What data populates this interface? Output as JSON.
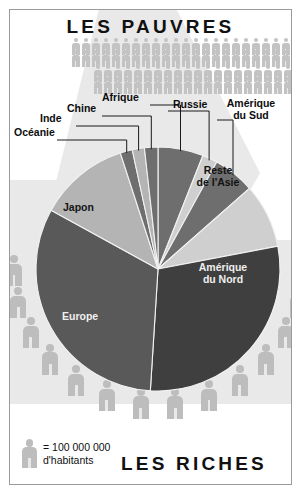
{
  "poster": {
    "title_top": "LES PAUVRES",
    "title_bottom": "LES RICHES"
  },
  "legend": {
    "icon": "person-icon",
    "line1": "= 100 000 000",
    "line2": "d'habitants",
    "unit_value": 100000000
  },
  "labels": {
    "oceanie": "Océanie",
    "inde": "Inde",
    "chine": "Chine",
    "afrique": "Afrique",
    "russie": "Russie",
    "amerique_du_sud_l1": "Amérique",
    "amerique_du_sud_l2": "du Sud",
    "reste_asie_l1": "Reste",
    "reste_asie_l2": "de l'Asie",
    "amerique_du_nord_l1": "Amérique",
    "amerique_du_nord_l2": "du Nord",
    "europe": "Europe",
    "japon": "Japon"
  },
  "colors": {
    "background": "#e9e9e9",
    "beam": "#ffffff",
    "frame": "#9a9a9a",
    "figure": "#bdbdbd",
    "figure_small": "#c3c3c3",
    "text": "#111111",
    "slice_dark": "#3f3f3f",
    "slice_mid": "#595959",
    "slice_mid2": "#6e6e6e",
    "slice_light": "#b4b4b4",
    "slice_lighter": "#cfcfcf",
    "slice_sep": "#f2f2f2",
    "leader_line": "#1a1a1a"
  },
  "chart_data": {
    "type": "pie",
    "center": {
      "x": 148,
      "y": 259
    },
    "radius": 122,
    "start_angle_deg": -90,
    "unit": "part de la richesse mondiale (%)",
    "labels": [
      "Afrique",
      "Russie",
      "Amérique du Sud",
      "Reste de l'Asie",
      "Amérique du Nord",
      "Europe",
      "Japon",
      "Océanie",
      "Inde",
      "Chine"
    ],
    "values": [
      6.0,
      2.0,
      5.5,
      8.5,
      29.0,
      32.0,
      12.0,
      1.6,
      1.6,
      1.8
    ],
    "slices": [
      {
        "name": "Afrique",
        "sweep_deg": 21.6,
        "color": "#6e6e6e",
        "label_type": "leader"
      },
      {
        "name": "Russie",
        "sweep_deg": 7.2,
        "color": "#cfcfcf",
        "label_type": "leader"
      },
      {
        "name": "Amérique du Sud",
        "sweep_deg": 19.8,
        "color": "#6e6e6e",
        "label_type": "leader"
      },
      {
        "name": "Reste de l'Asie",
        "sweep_deg": 30.6,
        "color": "#cfcfcf",
        "label_type": "inside"
      },
      {
        "name": "Amérique du Nord",
        "sweep_deg": 104.4,
        "color": "#3f3f3f",
        "label_type": "inside"
      },
      {
        "name": "Europe",
        "sweep_deg": 115.2,
        "color": "#595959",
        "label_type": "inside"
      },
      {
        "name": "Japon",
        "sweep_deg": 43.2,
        "color": "#b4b4b4",
        "label_type": "inside"
      },
      {
        "name": "Océanie",
        "sweep_deg": 5.8,
        "color": "#6e6e6e",
        "label_type": "leader"
      },
      {
        "name": "Inde",
        "sweep_deg": 5.8,
        "color": "#b4b4b4",
        "label_type": "leader"
      },
      {
        "name": "Chine",
        "sweep_deg": 6.4,
        "color": "#6e6e6e",
        "label_type": "leader"
      }
    ],
    "legend_position": "bottom-left",
    "grid": false
  },
  "crowd": {
    "top_rows": [
      {
        "count": 28,
        "x": 61,
        "y": 2,
        "scale": 1.0
      },
      {
        "count": 28,
        "x": 61,
        "y": 14,
        "scale": 1.0
      },
      {
        "count": 24,
        "x": 83,
        "y": 29,
        "scale": 1.0
      },
      {
        "count": 24,
        "x": 83,
        "y": 41,
        "scale": 1.0
      }
    ],
    "bottom_arc_count": 14
  }
}
